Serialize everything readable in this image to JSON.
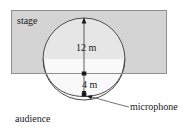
{
  "figure": {
    "type": "geometry-diagram",
    "background_color": "#ffffff",
    "stroke_color": "#4d4d4d",
    "text_color": "#1a1a1a",
    "stage": {
      "label": "stage",
      "fill_color": "#d4d4d4",
      "border_color": "#8c8c8c",
      "x": 11,
      "y": 10,
      "width": 156,
      "height": 64
    },
    "circle": {
      "center_x": 84,
      "center_y": 59,
      "radius": 41,
      "fill_color": "#f2f2f2"
    },
    "cardioid": {
      "cusp_x": 84,
      "cusp_y": 96,
      "description": "heart-shaped lobe below the stage meeting at the microphone point"
    },
    "dimensions": [
      {
        "name": "circle-diameter",
        "label": "12 m",
        "value": 12,
        "unit": "m",
        "from_y": 18,
        "to_y": 75
      },
      {
        "name": "cusp-offset",
        "label": "4 m",
        "value": 4,
        "unit": "m",
        "from_y": 75,
        "to_y": 96
      }
    ],
    "callouts": [
      {
        "name": "microphone",
        "label": "microphone",
        "target_x": 86,
        "target_y": 96
      }
    ],
    "annotations": [
      {
        "name": "audience",
        "label": "audience"
      }
    ]
  }
}
